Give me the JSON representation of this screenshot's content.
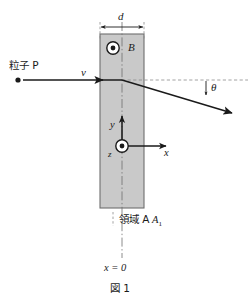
{
  "figure": {
    "caption": "図 1",
    "region_label": "領域 A",
    "region_label_sub": "1",
    "particle_label": "粒子 P",
    "width_label": "d",
    "field_label": "B",
    "velocity_label": "v",
    "angle_label": "θ",
    "axis_y_label": "y",
    "axis_x_label": "x",
    "axis_z_label": "z",
    "origin_label": "x = 0",
    "colors": {
      "region_fill": "#c9c9c9",
      "region_stroke": "#6e6e6e",
      "line": "#1a1a1a",
      "dashed": "#8a8a8a",
      "background": "#ffffff"
    },
    "geometry": {
      "region_left": 100,
      "region_right": 144,
      "region_top": 34,
      "region_bottom": 208,
      "center_x": 122,
      "incoming_y": 80,
      "deflection_x": 122,
      "exit_x": 231,
      "exit_y": 113,
      "origin_x": 122,
      "origin_y": 146
    }
  }
}
